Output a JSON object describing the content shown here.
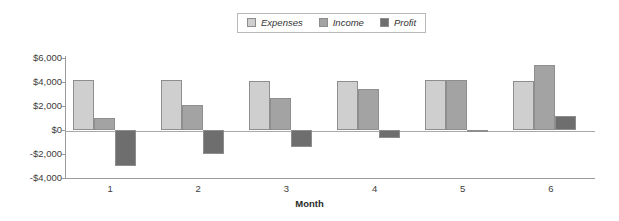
{
  "chart_data": {
    "type": "bar",
    "title": "",
    "xlabel": "Month",
    "ylabel": "",
    "categories": [
      "1",
      "2",
      "3",
      "4",
      "5",
      "6"
    ],
    "series": [
      {
        "name": "Expenses",
        "color": "#cfcfcf",
        "values": [
          4200,
          4150,
          4100,
          4100,
          4150,
          4100
        ]
      },
      {
        "name": "Income",
        "color": "#a3a3a3",
        "values": [
          1000,
          2050,
          2700,
          3450,
          4150,
          5400
        ]
      },
      {
        "name": "Profit",
        "color": "#6e6e6e",
        "values": [
          -3000,
          -2000,
          -1400,
          -650,
          -100,
          1200
        ]
      }
    ],
    "ylim": [
      -4000,
      6000
    ],
    "ytick_values": [
      6000,
      4000,
      2000,
      0,
      -2000,
      -4000
    ],
    "ytick_labels": [
      "$6,000",
      "$4,000",
      "$2,000",
      "$0",
      "-$2,000",
      "-$4,000"
    ],
    "grid": false,
    "legend_position": "top-center"
  },
  "legend": {
    "items": [
      {
        "label": "Expenses",
        "color": "#cfcfcf"
      },
      {
        "label": "Income",
        "color": "#a3a3a3"
      },
      {
        "label": "Profit",
        "color": "#6e6e6e"
      }
    ]
  },
  "axis": {
    "x_title": "Month"
  }
}
